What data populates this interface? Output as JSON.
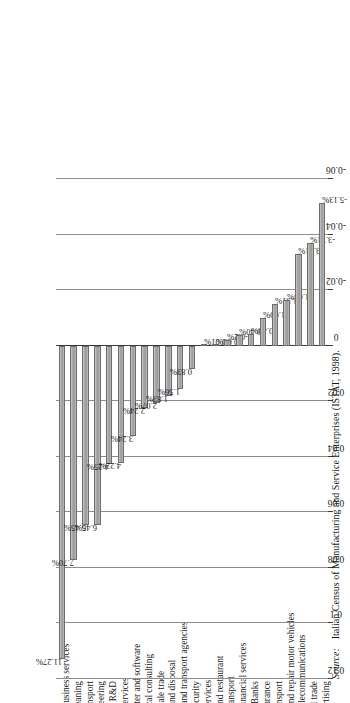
{
  "source": {
    "prefix": "Source:",
    "text": "Italian Census of Manufacturing and Service Enterprises (ISTAT, 1998)."
  },
  "chart_data": {
    "type": "bar",
    "orientation": "vertical",
    "title": "",
    "subtitle": "",
    "xlabel": "",
    "ylabel": "",
    "ylim": [
      -0.06,
      0.12
    ],
    "grid": true,
    "legend": null,
    "tick_labels": [
      "0.12",
      "0.1",
      "0.08",
      "0.06",
      "0.04",
      "0.02",
      "0",
      "-0.02",
      "-0.04",
      "-0.06"
    ],
    "ticks": [
      0.12,
      0.1,
      0.08,
      0.06,
      0.04,
      0.02,
      0,
      -0.02,
      -0.04,
      -0.06
    ],
    "bar_color": "#9b9b9b",
    "bar_edge_color": "#6d6d6d",
    "categories": [
      "Other business services",
      "Cleaning",
      "Sea transport",
      "Engineering",
      "R&D",
      "Legal services",
      "Computer and software",
      "Technical consulting",
      "Wholesale trade",
      "Waste and disposal",
      "Travel and transport agencies",
      "Security",
      "Total services",
      "Hotel and restaurant",
      "Land transport",
      "Other financial services",
      "Banks",
      "Insurance",
      "Air transport",
      "Trade and repair motor vehicles",
      "Post-Telecommunications",
      "Retail trade",
      "Advertising"
    ],
    "values": [
      0.1127,
      0.077,
      0.0645,
      0.0645,
      0.0425,
      0.0422,
      0.0324,
      0.0224,
      0.0207,
      0.0183,
      0.0156,
      0.0083,
      -0.0001,
      -0.0003,
      -0.002,
      -0.004,
      -0.0043,
      -0.01,
      -0.0151,
      -0.0165,
      -0.0331,
      -0.0371,
      -0.0513
    ],
    "data_labels": [
      "11.27%",
      "7.70%",
      "6.45%",
      "6.45%",
      "4.25%",
      "4.22%",
      "3.24%",
      "2.24%",
      "2.07%",
      "1.83%",
      "1.56%",
      "0.83%",
      "-0.01%",
      "-0.03%",
      "-0.2%",
      "-0.40%",
      "-0.43%",
      "-1.00%",
      "-1.51%",
      "-1.65%",
      "-3.31%",
      "-3.71%",
      "-5.13%"
    ]
  }
}
